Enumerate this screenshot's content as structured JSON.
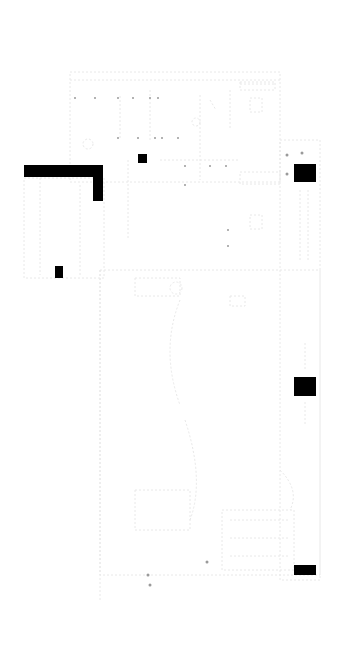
{
  "diagram": {
    "type": "circuit-schematic",
    "background": "#ffffff",
    "trace_color": "#e6e6e6",
    "block_color": "#000000",
    "filled_blocks": [
      {
        "x": 24,
        "y": 165,
        "w": 79,
        "h": 12
      },
      {
        "x": 93,
        "y": 165,
        "w": 10,
        "h": 36
      },
      {
        "x": 138,
        "y": 154,
        "w": 9,
        "h": 9
      },
      {
        "x": 55,
        "y": 266,
        "w": 8,
        "h": 12
      },
      {
        "x": 294,
        "y": 164,
        "w": 22,
        "h": 18
      },
      {
        "x": 294,
        "y": 377,
        "w": 22,
        "h": 19
      },
      {
        "x": 294,
        "y": 565,
        "w": 22,
        "h": 10
      }
    ],
    "regions": [
      {
        "name": "top-board",
        "x": 70,
        "y": 72,
        "w": 210,
        "h": 110
      },
      {
        "name": "left-panel",
        "x": 24,
        "y": 178,
        "w": 80,
        "h": 100
      },
      {
        "name": "lower-board",
        "x": 100,
        "y": 270,
        "w": 220,
        "h": 305
      },
      {
        "name": "right-connector-strip",
        "x": 280,
        "y": 140,
        "w": 40,
        "h": 440
      }
    ]
  }
}
